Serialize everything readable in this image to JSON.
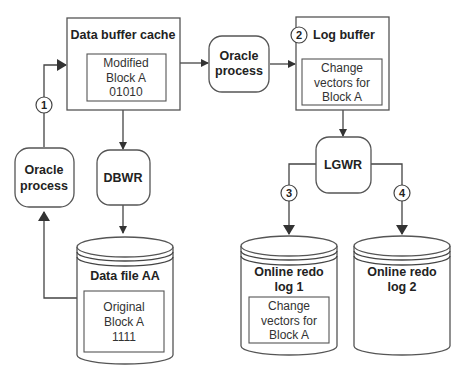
{
  "diagram": {
    "nodes": {
      "data_buffer_cache": {
        "title": "Data buffer cache",
        "content": [
          "Modified",
          "Block A",
          "01010"
        ]
      },
      "oracle_process_middle": {
        "label": [
          "Oracle",
          "process"
        ]
      },
      "log_buffer": {
        "title": "Log buffer",
        "content": [
          "Change",
          "vectors for",
          "Block A"
        ]
      },
      "oracle_process_left": {
        "label": [
          "Oracle",
          "process"
        ]
      },
      "dbwr": {
        "label": "DBWR"
      },
      "lgwr": {
        "label": "LGWR"
      },
      "data_file_aa": {
        "title": "Data file AA",
        "content": [
          "Original",
          "Block A",
          "1111"
        ]
      },
      "online_redo_log_1": {
        "title": [
          "Online redo",
          "log 1"
        ],
        "content": [
          "Change",
          "vectors for",
          "Block A"
        ]
      },
      "online_redo_log_2": {
        "title": [
          "Online redo",
          "log 2"
        ]
      }
    },
    "steps": [
      "1",
      "2",
      "3",
      "4"
    ],
    "edges": [
      {
        "from": "oracle_process_left",
        "to": "data_buffer_cache",
        "step": "1"
      },
      {
        "from": "data_buffer_cache",
        "to": "oracle_process_middle"
      },
      {
        "from": "oracle_process_middle",
        "to": "log_buffer",
        "step": "2"
      },
      {
        "from": "data_buffer_cache",
        "to": "dbwr"
      },
      {
        "from": "dbwr",
        "to": "data_file_aa"
      },
      {
        "from": "data_file_aa",
        "to": "oracle_process_left"
      },
      {
        "from": "log_buffer",
        "to": "lgwr"
      },
      {
        "from": "lgwr",
        "to": "online_redo_log_1",
        "step": "3"
      },
      {
        "from": "lgwr",
        "to": "online_redo_log_2",
        "step": "4"
      }
    ]
  }
}
